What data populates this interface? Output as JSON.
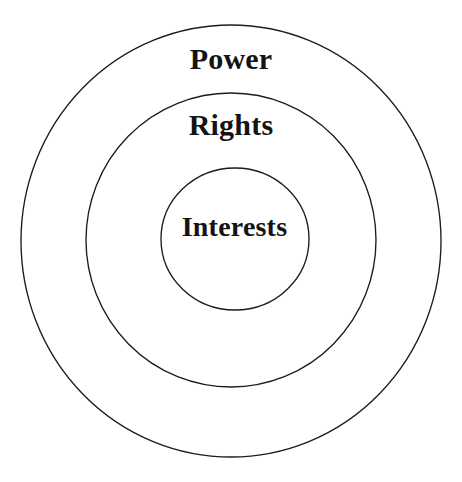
{
  "diagram": {
    "type": "concentric-circles",
    "title_visible": false,
    "background_color": "#ffffff",
    "stroke_color": "#1c1c1c",
    "text_color": "#141414",
    "canvas": {
      "width": 462,
      "height": 482
    },
    "rings": [
      {
        "id": "power",
        "label": "Power",
        "level": 1,
        "position": "outer",
        "center": {
          "x": 231,
          "y": 241
        },
        "radius_x": 210,
        "radius_y": 216,
        "label_position": {
          "x": 231,
          "y": 60
        }
      },
      {
        "id": "rights",
        "label": "Rights",
        "level": 2,
        "position": "middle",
        "center": {
          "x": 231,
          "y": 240
        },
        "radius_x": 145,
        "radius_y": 147,
        "label_position": {
          "x": 231,
          "y": 126
        }
      },
      {
        "id": "interests",
        "label": "Interests",
        "level": 3,
        "position": "inner",
        "center": {
          "x": 235,
          "y": 239
        },
        "radius_x": 74,
        "radius_y": 71,
        "label_position": {
          "x": 238,
          "y": 228
        }
      }
    ]
  }
}
